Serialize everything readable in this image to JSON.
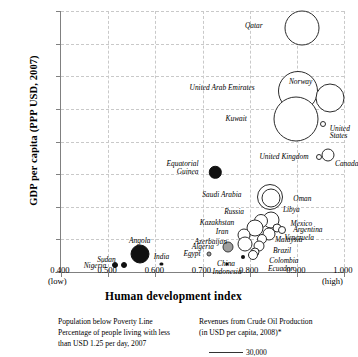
{
  "chart_data": {
    "type": "scatter",
    "title": "",
    "xlabel": "Human development index",
    "ylabel": "GDP per capita (PPP USD, 2007)",
    "xlim": [
      0.4,
      1.0
    ],
    "ylim": [
      0,
      80000
    ],
    "grid": true,
    "legend_position": "below",
    "x_low_note": "(low)",
    "x_high_note": "(high)",
    "xticks": [
      "0.400",
      "0.500",
      "0.600",
      "0.700",
      "0.800",
      "0.900",
      "1.000"
    ],
    "xtick_values": [
      0.4,
      0.5,
      0.6,
      0.7,
      0.8,
      0.9,
      1.0
    ],
    "yticks": [
      "0",
      "10,000",
      "20,000",
      "30,000",
      "40,000",
      "50,000",
      "60,000",
      "70,000",
      "80,000"
    ],
    "ytick_values": [
      0,
      10000,
      20000,
      30000,
      40000,
      50000,
      60000,
      70000,
      80000
    ],
    "size_encoding": "Revenues from Crude Oil Production (in USD per capita, 2008)",
    "fill_encoding": "Population below Poverty Line - Percentage of people living with less than USD 1.25 per day, 2007",
    "points": [
      {
        "name": "Qatar",
        "x": 0.91,
        "y": 74800,
        "r": 17.5,
        "fill": "white",
        "label_pos": "r"
      },
      {
        "name": "United Arab Emirates",
        "x": 0.903,
        "y": 55500,
        "r": 20.0,
        "fill": "white",
        "label_pos": "r"
      },
      {
        "name": "Norway",
        "x": 0.971,
        "y": 53400,
        "r": 14.5,
        "fill": "white",
        "label_pos": "r"
      },
      {
        "name": "Kuwait",
        "x": 0.898,
        "y": 47000,
        "r": 22.5,
        "fill": "white",
        "label_pos": "r"
      },
      {
        "name": "United States",
        "x": 0.956,
        "y": 45500,
        "r": 3.0,
        "fill": "white",
        "label_pos": "l"
      },
      {
        "name": "Canada",
        "x": 0.966,
        "y": 35800,
        "r": 6.5,
        "fill": "white",
        "label_pos": "l"
      },
      {
        "name": "United Kingdom",
        "x": 0.947,
        "y": 35200,
        "r": 3.0,
        "fill": "white",
        "label_pos": "r"
      },
      {
        "name": "Equatorial Guinea",
        "x": 0.727,
        "y": 30600,
        "r": 6.2,
        "fill": "black",
        "label_pos": "r"
      },
      {
        "name": "Saudi Arabia",
        "x": 0.843,
        "y": 22900,
        "r": 13.0,
        "fill": "white",
        "label_pos": "r"
      },
      {
        "name": "Oman",
        "x": 0.846,
        "y": 22600,
        "r": 9.5,
        "fill": "white",
        "label_pos": "l"
      },
      {
        "name": "Libya",
        "x": 0.845,
        "y": 16000,
        "r": 8.5,
        "fill": "white",
        "label_pos": "l"
      },
      {
        "name": "Russia",
        "x": 0.825,
        "y": 15500,
        "r": 7.0,
        "fill": "white",
        "label_pos": "r"
      },
      {
        "name": "Kazakhstan",
        "x": 0.812,
        "y": 13500,
        "r": 8.5,
        "fill": "white",
        "label_pos": "r"
      },
      {
        "name": "Mexico",
        "x": 0.857,
        "y": 13500,
        "r": 4.5,
        "fill": "white",
        "label_pos": "l"
      },
      {
        "name": "Argentina",
        "x": 0.868,
        "y": 13000,
        "r": 4.0,
        "fill": "white",
        "label_pos": "l"
      },
      {
        "name": "Venezuela",
        "x": 0.842,
        "y": 11500,
        "r": 6.5,
        "fill": "white",
        "label_pos": "l"
      },
      {
        "name": "Iran",
        "x": 0.789,
        "y": 11200,
        "r": 6.5,
        "fill": "white",
        "label_pos": "r"
      },
      {
        "name": "Malaysia",
        "x": 0.827,
        "y": 10000,
        "r": 5.0,
        "fill": "white",
        "label_pos": "l"
      },
      {
        "name": "Azerbaijan",
        "x": 0.79,
        "y": 8600,
        "r": 7.5,
        "fill": "white",
        "label_pos": "r"
      },
      {
        "name": "Brazil",
        "x": 0.82,
        "y": 8000,
        "r": 5.5,
        "fill": "white",
        "label_pos": "l"
      },
      {
        "name": "Algeria",
        "x": 0.754,
        "y": 7600,
        "r": 5.5,
        "fill": "grey",
        "label_pos": "r"
      },
      {
        "name": "Colombia",
        "x": 0.812,
        "y": 6000,
        "r": 4.5,
        "fill": "white",
        "label_pos": "l"
      },
      {
        "name": "Ecuador",
        "x": 0.808,
        "y": 5100,
        "r": 5.0,
        "fill": "white",
        "label_pos": "l"
      },
      {
        "name": "China",
        "x": 0.785,
        "y": 4700,
        "r": 2.0,
        "fill": "black",
        "label_pos": "r"
      },
      {
        "name": "Egypt",
        "x": 0.713,
        "y": 5400,
        "r": 2.5,
        "fill": "grey",
        "label_pos": "r"
      },
      {
        "name": "Angola",
        "x": 0.567,
        "y": 5500,
        "r": 9.5,
        "fill": "black",
        "label_pos": "c"
      },
      {
        "name": "Sudan",
        "x": 0.534,
        "y": 2200,
        "r": 3.0,
        "fill": "black",
        "label_pos": "r"
      },
      {
        "name": "Nigeria",
        "x": 0.514,
        "y": 2100,
        "r": 3.0,
        "fill": "black",
        "label_pos": "r"
      },
      {
        "name": "India",
        "x": 0.613,
        "y": 2400,
        "r": 1.6,
        "fill": "black",
        "label_pos": "c"
      },
      {
        "name": "Indonesia",
        "x": 0.752,
        "y": 2600,
        "r": 1.6,
        "fill": "black",
        "label_pos": "c"
      }
    ]
  },
  "legend": {
    "left_lines": [
      "Population below Poverty Line",
      "Percentage of people living with less",
      "than USD 1.25 per day, 2007"
    ],
    "right_lines": [
      "Revenues from Crude Oil Production",
      "(in USD per capita, 2008)*"
    ],
    "scale_value": "30,000"
  }
}
